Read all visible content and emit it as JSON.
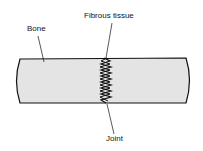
{
  "labels": {
    "bone": "Bone",
    "fibrous_tissue": "Fibrous tissue",
    "joint": "Joint"
  },
  "colors": {
    "bone_fill": "#e4e4e4",
    "outline": "#111111"
  }
}
